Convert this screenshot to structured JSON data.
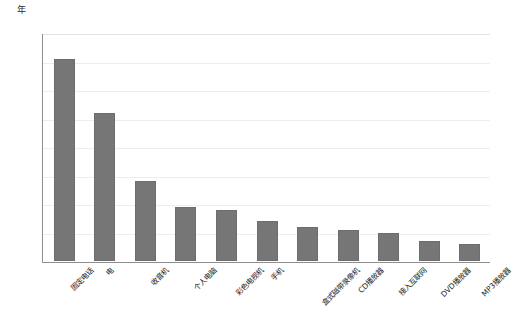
{
  "chart_data": {
    "type": "bar",
    "title": "",
    "subtitle": "",
    "xlabel": "",
    "ylabel": "年",
    "ylim": [
      0,
      80
    ],
    "yticks": [
      0,
      10,
      20,
      30,
      40,
      50,
      60,
      70,
      80
    ],
    "grid": true,
    "legend": false,
    "bar_color": "#767676",
    "axis_color": "#8e8e8e",
    "grid_color": "#ededed",
    "categories": [
      "固定电话",
      "电",
      "收音机",
      "个人电脑",
      "彩色电视机",
      "手机",
      "盒式磁带录像机",
      "CD播放器",
      "接入互联网",
      "DVD播放器",
      "MP3播放器"
    ],
    "values": [
      71,
      52,
      28,
      19,
      18,
      14,
      12,
      11,
      10,
      7,
      6
    ]
  }
}
